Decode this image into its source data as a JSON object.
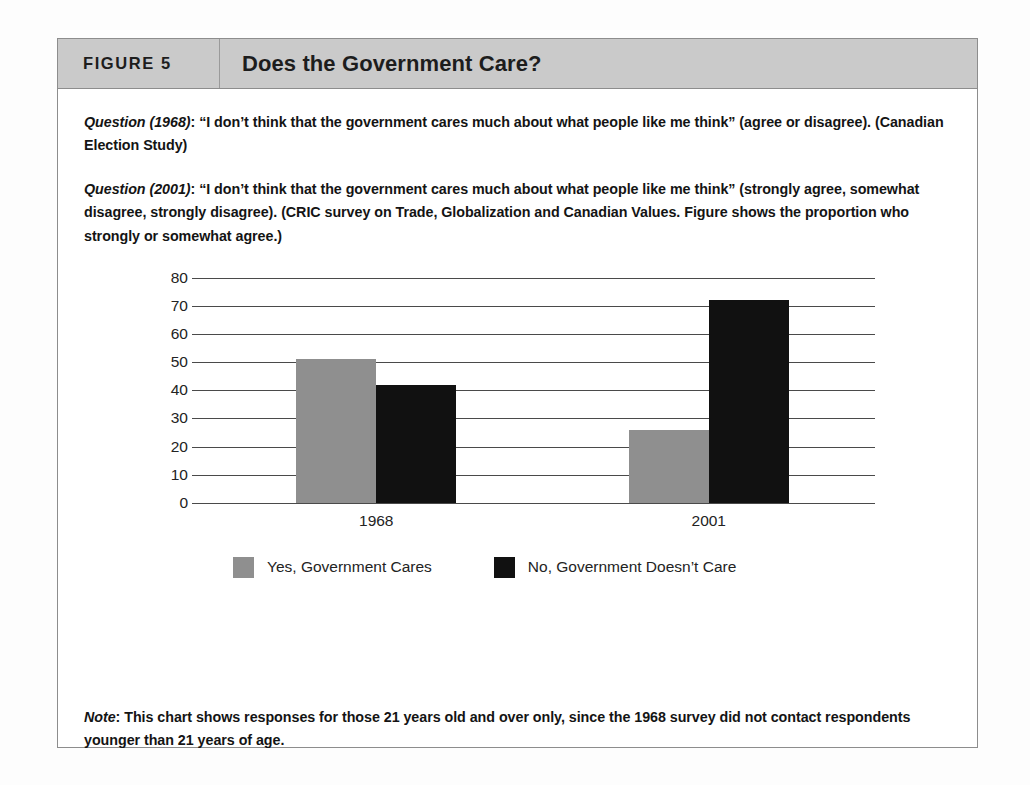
{
  "figure": {
    "label": "FIGURE 5",
    "title": "Does the Government Care?"
  },
  "questions": [
    {
      "lead": "Question (1968)",
      "body": ": “I don’t think that the government cares much about what people like me think” (agree or disagree). (Canadian Election Study)"
    },
    {
      "lead": "Question (2001)",
      "body": ": “I don’t think that the government cares much about what people like me think” (strongly agree, somewhat disagree, strongly disagree). (CRIC survey on Trade, Globalization and Canadian Values. Figure shows the proportion who strongly or somewhat agree.)"
    }
  ],
  "note": {
    "lead": "Note",
    "body": ": This chart shows responses for those 21 years old and over only, since the 1968 survey did not contact respondents younger than 21 years of age."
  },
  "chart_data": {
    "type": "bar",
    "title": "Does the Government Care?",
    "xlabel": "",
    "ylabel": "",
    "categories": [
      "1968",
      "2001"
    ],
    "series": [
      {
        "name": "Yes, Government Cares",
        "color": "#8f8f8f",
        "values": [
          51,
          26
        ]
      },
      {
        "name": "No, Government Doesn’t Care",
        "color": "#111111",
        "values": [
          42,
          72
        ]
      }
    ],
    "ylim": [
      0,
      80
    ],
    "yticks": [
      80,
      70,
      60,
      50,
      40,
      30,
      20,
      10,
      0
    ],
    "grid": true,
    "legend_position": "bottom-left"
  },
  "colors": {
    "header_band": "#cacaca",
    "border": "#8d8d8d",
    "gray_series": "#8f8f8f",
    "black_series": "#111111",
    "gridline": "#4a4a4a"
  }
}
